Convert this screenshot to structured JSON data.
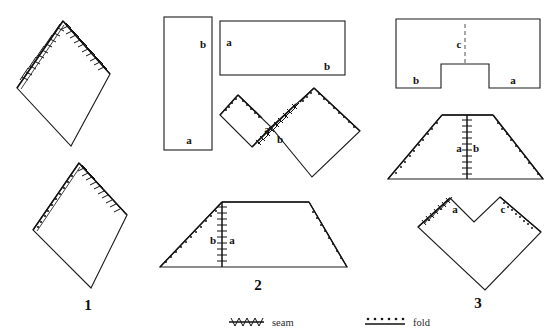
{
  "figure": {
    "panels": [
      {
        "number": "1",
        "name": "panel-1",
        "shapes": [
          {
            "name": "diamond-top-seamed",
            "kind": "diamond",
            "edge_marks": [
              "seam-upper-left",
              "seam-upper-right"
            ],
            "labels": []
          },
          {
            "name": "diamond-bottom-folded",
            "kind": "diamond",
            "edge_marks": [
              "fold-upper-left",
              "seam-upper-right"
            ],
            "labels": []
          }
        ]
      },
      {
        "number": "2",
        "name": "panel-2",
        "shapes": [
          {
            "name": "rectangle-vertical",
            "kind": "rectangle",
            "edge_marks": [],
            "labels": [
              "b",
              "a"
            ]
          },
          {
            "name": "rectangle-horizontal",
            "kind": "rectangle",
            "edge_marks": [],
            "labels": [
              "a",
              "b"
            ]
          },
          {
            "name": "joined-rotated-rectangles",
            "kind": "two-rotated-rectangles",
            "edge_marks": [
              "fold-upper-left-small",
              "fold-upper-right-large",
              "seam-join"
            ],
            "labels": [
              "a",
              "b"
            ]
          },
          {
            "name": "trapezoid-2",
            "kind": "trapezoid",
            "edge_marks": [
              "fold-left-slant",
              "fold-right-slant",
              "seam-center-vertical"
            ],
            "labels": [
              "b",
              "a"
            ]
          }
        ]
      },
      {
        "number": "3",
        "name": "panel-3",
        "shapes": [
          {
            "name": "notched-rectangle",
            "kind": "rectangle-with-notch",
            "edge_marks": [
              "center-dashed"
            ],
            "labels": [
              "c",
              "b",
              "a"
            ]
          },
          {
            "name": "trapezoid-3",
            "kind": "trapezoid",
            "edge_marks": [
              "fold-left-slant",
              "fold-right-slant",
              "seam-center-vertical"
            ],
            "labels": [
              "a",
              "b"
            ]
          },
          {
            "name": "notched-diamond",
            "kind": "heart-diamond",
            "edge_marks": [
              "seam-upper-left",
              "fold-upper-right"
            ],
            "labels": [
              "a",
              "c"
            ]
          }
        ]
      }
    ],
    "panel_numbers": {
      "one": "1",
      "two": "2",
      "three": "3"
    },
    "piece_labels": {
      "a": "a",
      "b": "b",
      "c": "c"
    },
    "legend": {
      "seam_label": "seam",
      "fold_label": "fold"
    },
    "colors": {
      "ink": "#1a1a1a",
      "paper": "#ffffff",
      "dash": "#3a3a3a"
    }
  }
}
